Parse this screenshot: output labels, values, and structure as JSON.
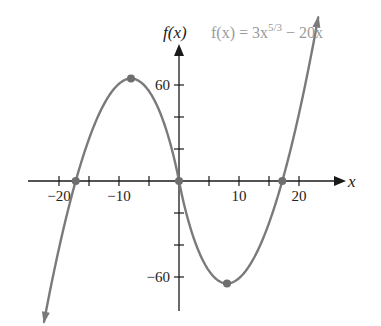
{
  "chart_data": {
    "type": "line",
    "title": "",
    "function_label": "f(x) = 3x^(5/3) − 20x",
    "function_label_parts": {
      "lhs": "f(x) = 3x",
      "exponent": "5/3",
      "rhs": " − 20x"
    },
    "xlabel": "x",
    "ylabel": "f(x)",
    "xlim": [
      -23,
      25
    ],
    "ylim": [
      -80,
      85
    ],
    "x_ticks": [
      -20,
      -15,
      -10,
      -5,
      5,
      10,
      15,
      20
    ],
    "x_tick_labels": [
      {
        "value": -20,
        "label": "−20"
      },
      {
        "value": -10,
        "label": "−10"
      },
      {
        "value": 10,
        "label": "10"
      },
      {
        "value": 20,
        "label": "20"
      }
    ],
    "y_ticks": [
      -60,
      -40,
      -20,
      20,
      40,
      60
    ],
    "y_tick_labels": [
      {
        "value": 60,
        "label": "60"
      },
      {
        "value": -60,
        "label": "−60"
      }
    ],
    "grid": false,
    "legend": "none",
    "series": [
      {
        "name": "f(x) = 3x^(5/3) − 20x",
        "x_range": [
          -22.5,
          23.2
        ],
        "arrows_at_ends": true,
        "color": "#7a7a7a"
      }
    ],
    "marked_points": [
      {
        "x": -17.21,
        "y": 0,
        "kind": "zero"
      },
      {
        "x": -8,
        "y": 64,
        "kind": "local max"
      },
      {
        "x": 0,
        "y": 0,
        "kind": "zero"
      },
      {
        "x": 8,
        "y": -64,
        "kind": "local min"
      },
      {
        "x": 17.21,
        "y": 0,
        "kind": "zero"
      }
    ]
  },
  "colors": {
    "axis": "#1a1a1a",
    "curve": "#7a7a7a",
    "points": "#6e6e6e",
    "equation": "#9a9a9a"
  }
}
